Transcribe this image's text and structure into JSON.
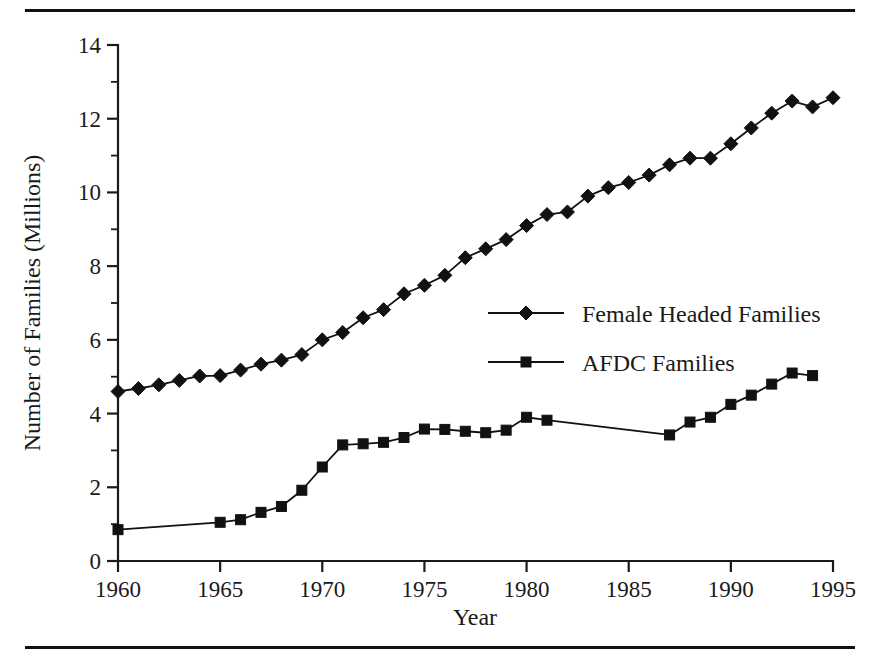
{
  "figure": {
    "has_top_rule": true,
    "has_bottom_rule": true,
    "background_color": "#ffffff",
    "ink_color": "#111111"
  },
  "chart_data": {
    "type": "line",
    "title": "",
    "subtitle": "",
    "xlabel": "Year",
    "ylabel": "Number of Families (Millions)",
    "xlim": [
      1960,
      1995
    ],
    "ylim": [
      0,
      14
    ],
    "grid": false,
    "legend_position": "center-right",
    "x_tick_labels": [
      "1960",
      "1965",
      "1970",
      "1975",
      "1980",
      "1985",
      "1990",
      "1995"
    ],
    "x_tick_values": [
      1960,
      1965,
      1970,
      1975,
      1980,
      1985,
      1990,
      1995
    ],
    "x_minor_step": 1,
    "y_tick_labels": [
      "0",
      "2",
      "4",
      "6",
      "8",
      "10",
      "12",
      "14"
    ],
    "y_tick_values": [
      0,
      2,
      4,
      6,
      8,
      10,
      12,
      14
    ],
    "y_minor_values": [
      1,
      3,
      5,
      7,
      9,
      11,
      13
    ],
    "series": [
      {
        "name": "Female Headed Families",
        "marker": "diamond",
        "color": "#111111",
        "x": [
          1960,
          1961,
          1962,
          1963,
          1964,
          1965,
          1966,
          1967,
          1968,
          1969,
          1970,
          1971,
          1972,
          1973,
          1974,
          1975,
          1976,
          1977,
          1978,
          1979,
          1980,
          1981,
          1982,
          1983,
          1984,
          1985,
          1986,
          1987,
          1988,
          1989,
          1990,
          1991,
          1992,
          1993,
          1994,
          1995
        ],
        "values": [
          4.6,
          4.68,
          4.78,
          4.9,
          5.02,
          5.03,
          5.18,
          5.34,
          5.45,
          5.6,
          6.0,
          6.2,
          6.6,
          6.82,
          7.25,
          7.48,
          7.75,
          8.23,
          8.47,
          8.72,
          9.1,
          9.4,
          9.47,
          9.9,
          10.13,
          10.27,
          10.47,
          10.75,
          10.93,
          10.93,
          11.32,
          11.75,
          12.15,
          12.48,
          12.32,
          12.57
        ]
      },
      {
        "name": "AFDC Families",
        "marker": "square",
        "color": "#111111",
        "x": [
          1960,
          1965,
          1966,
          1967,
          1968,
          1969,
          1970,
          1971,
          1972,
          1973,
          1974,
          1975,
          1976,
          1977,
          1978,
          1979,
          1980,
          1981,
          1987,
          1988,
          1989,
          1990,
          1991,
          1992,
          1993,
          1994
        ],
        "values": [
          0.85,
          1.05,
          1.12,
          1.32,
          1.48,
          1.92,
          2.55,
          3.15,
          3.18,
          3.22,
          3.35,
          3.58,
          3.57,
          3.52,
          3.48,
          3.55,
          3.9,
          3.82,
          3.42,
          3.77,
          3.9,
          4.25,
          4.5,
          4.8,
          5.1,
          5.03
        ]
      }
    ],
    "notes": [
      "AFDC series has no plotted markers for 1961-1964 and 1982-1986; the line is drawn straight across those gaps."
    ]
  },
  "legend": {
    "entries": [
      {
        "label": "Female Headed Families",
        "marker": "diamond"
      },
      {
        "label": "AFDC Families",
        "marker": "square"
      }
    ]
  }
}
